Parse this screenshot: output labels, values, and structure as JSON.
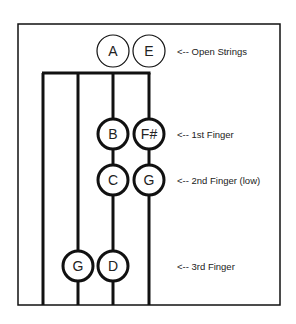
{
  "diagram": {
    "colors": {
      "line": "#111111",
      "background": "#ffffff",
      "text": "#222222"
    },
    "strings": [
      {
        "name": "G",
        "x": 43
      },
      {
        "name": "D",
        "x": 78
      },
      {
        "name": "A",
        "x": 113
      },
      {
        "name": "E",
        "x": 149
      }
    ],
    "open_strings": [
      {
        "note": "A",
        "string_index": 2
      },
      {
        "note": "E",
        "string_index": 3
      }
    ],
    "rows": [
      {
        "label": "<-- Open Strings",
        "y": 51,
        "notes": [
          {
            "note": "A",
            "x": 113,
            "style": "open"
          },
          {
            "note": "E",
            "x": 149,
            "style": "open"
          }
        ]
      },
      {
        "label": "<-- 1st Finger",
        "y": 134,
        "notes": [
          {
            "note": "B",
            "x": 113,
            "style": "finger"
          },
          {
            "note": "F#",
            "x": 149,
            "style": "finger"
          }
        ]
      },
      {
        "label": "<-- 2nd Finger (low)",
        "y": 180,
        "notes": [
          {
            "note": "C",
            "x": 113,
            "style": "finger"
          },
          {
            "note": "G",
            "x": 149,
            "style": "finger"
          }
        ]
      },
      {
        "label": "<-- 3rd Finger",
        "y": 266,
        "notes": [
          {
            "note": "G",
            "x": 78,
            "style": "finger"
          },
          {
            "note": "D",
            "x": 113,
            "style": "finger"
          }
        ]
      }
    ]
  }
}
